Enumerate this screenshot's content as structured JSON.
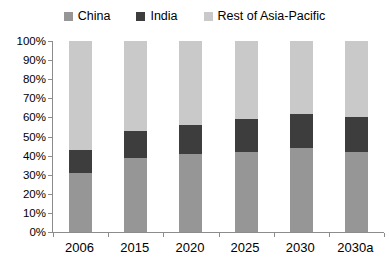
{
  "chart_data": {
    "type": "bar",
    "stacked": true,
    "title": "",
    "xlabel": "",
    "ylabel": "",
    "categories": [
      "2006",
      "2015",
      "2020",
      "2025",
      "2030",
      "2030a"
    ],
    "series": [
      {
        "name": "China",
        "color": "#969696",
        "values": [
          31,
          39,
          41,
          42,
          44,
          42
        ]
      },
      {
        "name": "India",
        "color": "#3d3d3d",
        "values": [
          12,
          14,
          15,
          17,
          18,
          18
        ]
      },
      {
        "name": "Rest of Asia-Pacific",
        "color": "#c9c9c9",
        "values": [
          57,
          47,
          44,
          41,
          38,
          40
        ]
      }
    ],
    "ylim": [
      0,
      100
    ],
    "ytick_step": 10,
    "ytick_labels": [
      "0%",
      "10%",
      "20%",
      "30%",
      "40%",
      "50%",
      "60%",
      "70%",
      "80%",
      "90%",
      "100%"
    ],
    "legend_position": "top-center",
    "grid": false,
    "axis_color": "#8c8c8c",
    "background_color": "#ffffff"
  }
}
